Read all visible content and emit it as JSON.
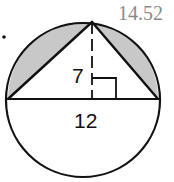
{
  "answer": "14.52",
  "diagram": {
    "height_label": "7",
    "base_label": "12",
    "shaded_color": "#c8c8c8",
    "stroke_color": "#111111"
  }
}
